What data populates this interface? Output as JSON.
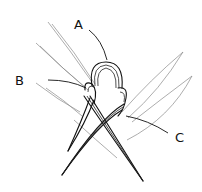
{
  "diagram": {
    "labels": [
      {
        "id": "A",
        "text": "A",
        "x": 74,
        "y": 18
      },
      {
        "id": "B",
        "text": "B",
        "x": 15,
        "y": 74
      },
      {
        "id": "C",
        "text": "C",
        "x": 175,
        "y": 131
      }
    ],
    "colors": {
      "ink": "#111111",
      "background": "#ffffff",
      "faint": "#8a8a8a"
    }
  }
}
